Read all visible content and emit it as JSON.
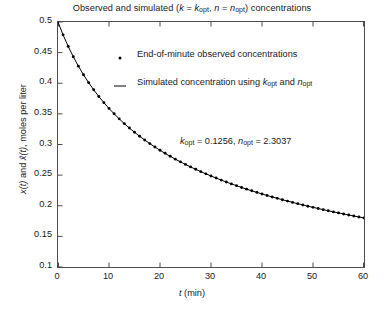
{
  "chart_data": {
    "type": "line",
    "xlabel": "t (min)",
    "ylabel": "x(t) and x̂(t), moles per liter",
    "xlim": [
      0,
      60
    ],
    "ylim": [
      0.1,
      0.5
    ],
    "xticks": [
      0,
      10,
      20,
      30,
      40,
      50,
      60
    ],
    "yticks": [
      0.1,
      0.15,
      0.2,
      0.25,
      0.3,
      0.35,
      0.4,
      0.45,
      0.5
    ],
    "xtick_labels": [
      "0",
      "10",
      "20",
      "30",
      "40",
      "50",
      "60"
    ],
    "ytick_labels": [
      "0.1",
      "0.15",
      "0.2",
      "0.25",
      "0.3",
      "0.35",
      "0.4",
      "0.45",
      "0.5"
    ],
    "grid": false,
    "legend_position": "upper-center",
    "legend": [
      {
        "marker": "dot",
        "label": "End-of-minute observed concentrations"
      },
      {
        "marker": "line",
        "label": "Simulated concentration using k_opt and n_opt"
      }
    ],
    "annotation": "k_opt = 0.1256, n_opt = 2.3037",
    "parameters": {
      "k_opt": 0.1256,
      "n_opt": 2.3037,
      "x0": 0.5
    },
    "model": "x(t) = [x0^(1-n) + (n-1)*k*t]^(1/(1-n))",
    "series": [
      {
        "name": "End-of-minute observed concentrations",
        "marker": "dot",
        "x": [
          1,
          2,
          3,
          4,
          5,
          6,
          7,
          8,
          9,
          10,
          11,
          12,
          13,
          14,
          15,
          16,
          17,
          18,
          19,
          20,
          21,
          22,
          23,
          24,
          25,
          26,
          27,
          28,
          29,
          30,
          31,
          32,
          33,
          34,
          35,
          36,
          37,
          38,
          39,
          40,
          41,
          42,
          43,
          44,
          45,
          46,
          47,
          48,
          49,
          50,
          51,
          52,
          53,
          54,
          55,
          56,
          57,
          58,
          59,
          60
        ],
        "y": [
          0.479,
          0.4602,
          0.4433,
          0.4279,
          0.4139,
          0.4011,
          0.3893,
          0.3784,
          0.3683,
          0.3589,
          0.3501,
          0.3419,
          0.3341,
          0.3269,
          0.32,
          0.3135,
          0.3073,
          0.3015,
          0.2959,
          0.2906,
          0.2856,
          0.2807,
          0.2761,
          0.2717,
          0.2675,
          0.2634,
          0.2595,
          0.2557,
          0.2521,
          0.2486,
          0.2452,
          0.2419,
          0.2388,
          0.2357,
          0.2328,
          0.2299,
          0.2271,
          0.2244,
          0.2218,
          0.2193,
          0.2168,
          0.2144,
          0.2121,
          0.2098,
          0.2076,
          0.2055,
          0.2034,
          0.2013,
          0.1993,
          0.1974,
          0.1955,
          0.1936,
          0.1918,
          0.19,
          0.1883,
          0.1866,
          0.1849,
          0.1833,
          0.1817,
          0.1801
        ]
      },
      {
        "name": "Simulated concentration using k_opt and n_opt",
        "marker": "line",
        "x": [
          0,
          1,
          2,
          3,
          4,
          5,
          6,
          7,
          8,
          9,
          10,
          11,
          12,
          13,
          14,
          15,
          16,
          17,
          18,
          19,
          20,
          21,
          22,
          23,
          24,
          25,
          26,
          27,
          28,
          29,
          30,
          31,
          32,
          33,
          34,
          35,
          36,
          37,
          38,
          39,
          40,
          41,
          42,
          43,
          44,
          45,
          46,
          47,
          48,
          49,
          50,
          51,
          52,
          53,
          54,
          55,
          56,
          57,
          58,
          59,
          60
        ],
        "y": [
          0.5,
          0.479,
          0.4602,
          0.4433,
          0.4279,
          0.4139,
          0.4011,
          0.3893,
          0.3784,
          0.3683,
          0.3589,
          0.3501,
          0.3419,
          0.3341,
          0.3269,
          0.32,
          0.3135,
          0.3073,
          0.3015,
          0.2959,
          0.2906,
          0.2856,
          0.2807,
          0.2761,
          0.2717,
          0.2675,
          0.2634,
          0.2595,
          0.2557,
          0.2521,
          0.2486,
          0.2452,
          0.2419,
          0.2388,
          0.2357,
          0.2328,
          0.2299,
          0.2271,
          0.2244,
          0.2218,
          0.2193,
          0.2168,
          0.2144,
          0.2121,
          0.2098,
          0.2076,
          0.2055,
          0.2034,
          0.2013,
          0.1993,
          0.1974,
          0.1955,
          0.1936,
          0.1918,
          0.19,
          0.1883,
          0.1866,
          0.1849,
          0.1833,
          0.1817,
          0.1801
        ]
      }
    ]
  },
  "title_parts": {
    "pre": "Observed and simulated (",
    "k": "k",
    "eq1": " = ",
    "kopt": "k",
    "koptsub": "opt",
    "comma": ", ",
    "n": "n",
    "eq2": " = ",
    "nopt": "n",
    "noptsub": "opt",
    "post": ") concentrations"
  },
  "legend_text": {
    "observed": "End-of-minute observed concentrations",
    "simulated_pre": "Simulated concentration using ",
    "simulated_k": "k",
    "simulated_ksub": "opt",
    "simulated_mid": " and ",
    "simulated_n": "n",
    "simulated_nsub": "opt"
  },
  "annotation_text": {
    "k": "k",
    "ksub": "opt",
    "keq": " = 0.1256, ",
    "n": "n",
    "nsub": "opt",
    "neq": " = 2.3037"
  },
  "axis_text": {
    "xlabel_t": "t",
    "xlabel_unit": " (min)",
    "ylabel_x1": "x",
    "ylabel_t1": "(t)",
    "ylabel_and": " and ",
    "ylabel_xhat": "x̂",
    "ylabel_t2": "(t)",
    "ylabel_unit": ", moles per liter"
  },
  "colors": {
    "axis": "#4d4d4d",
    "curve": "#000000",
    "marker": "#000000",
    "text": "#1a1a1a",
    "background": "#ffffff"
  }
}
